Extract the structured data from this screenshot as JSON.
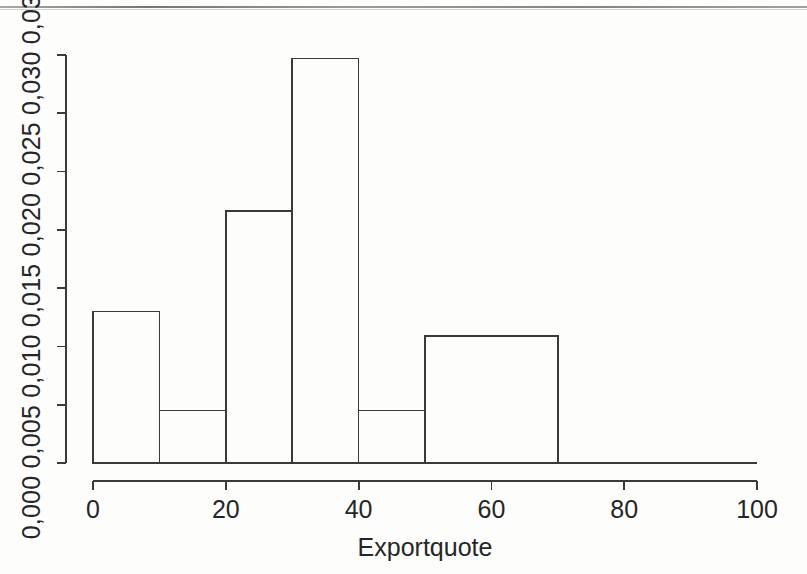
{
  "figure": {
    "type": "histogram",
    "background_color": "#fdfdfc",
    "line_color": "#3a3a3a",
    "text_color": "#262626",
    "has_scan_artifact_line": true
  },
  "chart_data": {
    "type": "bar",
    "title": "",
    "subtitle": "",
    "xlabel": "Exportquote",
    "ylabel": "",
    "ylabel_text": "0,000 0,005 0,010 0,015 0,020 0,025 0,030 0,035",
    "xlim": [
      0,
      100
    ],
    "ylim": [
      0.0,
      0.035
    ],
    "xticks": [
      0,
      20,
      40,
      60,
      80,
      100
    ],
    "xtick_labels": [
      "0",
      "20",
      "40",
      "60",
      "80",
      "100"
    ],
    "yticks": [
      0.0,
      0.005,
      0.01,
      0.015,
      0.02,
      0.025,
      0.03,
      0.035
    ],
    "ytick_labels": [
      "0,000",
      "0,005",
      "0,010",
      "0,015",
      "0,020",
      "0,025",
      "0,030",
      "0,035"
    ],
    "grid": false,
    "legend": null,
    "bin_edges": [
      0,
      10,
      20,
      30,
      40,
      50,
      70
    ],
    "categories": [
      "0-10",
      "10-20",
      "20-30",
      "30-40",
      "40-50",
      "50-70"
    ],
    "values": [
      0.013,
      0.0045,
      0.0216,
      0.0347,
      0.0045,
      0.0109
    ],
    "bars": [
      {
        "x0": 0,
        "x1": 10,
        "density": 0.013
      },
      {
        "x0": 10,
        "x1": 20,
        "density": 0.0045
      },
      {
        "x0": 20,
        "x1": 30,
        "density": 0.0216
      },
      {
        "x0": 30,
        "x1": 40,
        "density": 0.0347
      },
      {
        "x0": 40,
        "x1": 50,
        "density": 0.0045
      },
      {
        "x0": 50,
        "x1": 70,
        "density": 0.0109
      }
    ],
    "bar_fill": "none",
    "bar_edge_color": "#3a3a3a"
  }
}
